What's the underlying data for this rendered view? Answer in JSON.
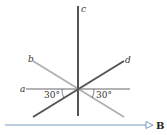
{
  "diagram": {
    "wires": [
      {
        "id": "a",
        "label": "a",
        "orientation": "horizontal",
        "color": "#9a9a9a"
      },
      {
        "id": "b",
        "label": "b",
        "orientation": "diagonal-down-right",
        "color": "#b0b0b0"
      },
      {
        "id": "c",
        "label": "c",
        "orientation": "vertical",
        "color": "#555555"
      },
      {
        "id": "d",
        "label": "d",
        "orientation": "diagonal-up-right",
        "color": "#555555"
      }
    ],
    "angles": [
      {
        "label": "30°",
        "between": [
          "a",
          "d"
        ],
        "side": "left"
      },
      {
        "label": "30°",
        "between": [
          "a",
          "b"
        ],
        "side": "right"
      }
    ],
    "field": {
      "label": "B",
      "direction": "right",
      "color": "#7a9bbf"
    }
  }
}
